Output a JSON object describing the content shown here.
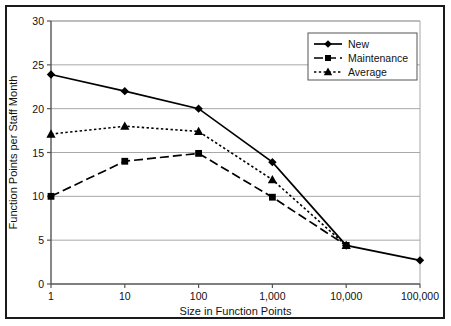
{
  "chart_data": {
    "type": "line",
    "title": "",
    "xlabel": "Size in Function Points",
    "ylabel": "Function Points per Staff Month",
    "x_scale": "log",
    "categories": [
      "1",
      "10",
      "100",
      "1,000",
      "10,000",
      "100,000"
    ],
    "x_tick_labels": [
      "1",
      "10",
      "100",
      "1,000",
      "10,000",
      "100,000"
    ],
    "y_tick_labels": [
      "0",
      "5",
      "10",
      "15",
      "20",
      "25",
      "30"
    ],
    "ylim": [
      0,
      30
    ],
    "y_ticks": [
      0,
      5,
      10,
      15,
      20,
      25,
      30
    ],
    "grid": "horizontal",
    "legend_position": "top-right",
    "series": [
      {
        "name": "New",
        "line_style": "solid",
        "marker": "diamond",
        "color": "#000000",
        "x": [
          "1",
          "10",
          "100",
          "1,000",
          "10,000",
          "100,000"
        ],
        "values": [
          23.9,
          22.0,
          20.0,
          13.9,
          4.4,
          2.7
        ]
      },
      {
        "name": "Maintenance",
        "line_style": "dashed",
        "marker": "square",
        "color": "#000000",
        "x": [
          "1",
          "10",
          "100",
          "1,000",
          "10,000"
        ],
        "values": [
          10.0,
          14.0,
          14.9,
          9.9,
          4.4
        ]
      },
      {
        "name": "Average",
        "line_style": "dotted",
        "marker": "triangle",
        "color": "#000000",
        "x": [
          "1",
          "10",
          "100",
          "1,000",
          "10,000"
        ],
        "values": [
          17.1,
          18.0,
          17.4,
          11.9,
          4.4
        ]
      }
    ]
  },
  "legend": {
    "items": [
      {
        "label": "New"
      },
      {
        "label": "Maintenance"
      },
      {
        "label": "Average"
      }
    ]
  },
  "colors": {
    "ink": "#000000",
    "frame": "#1a1a1a",
    "grid": "#a8a8a8",
    "axis": "#555555",
    "background": "#ffffff"
  }
}
